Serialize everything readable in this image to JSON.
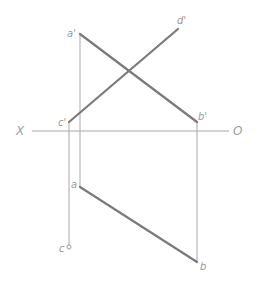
{
  "diagram": {
    "type": "orthographic-projection",
    "axis": {
      "left_label": "X",
      "right_label": "O",
      "y": 131,
      "x1": 32,
      "x2": 229
    },
    "points": {
      "a_prime": {
        "label": "a'",
        "x": 80,
        "y": 34
      },
      "b_prime": {
        "label": "b'",
        "x": 197,
        "y": 122
      },
      "c_prime": {
        "label": "c'",
        "x": 69,
        "y": 122
      },
      "d_prime": {
        "label": "d'",
        "x": 178,
        "y": 29
      },
      "a": {
        "label": "a",
        "x": 80,
        "y": 187
      },
      "b": {
        "label": "b",
        "x": 197,
        "y": 262
      },
      "c": {
        "label": "c",
        "x": 69,
        "y": 247
      }
    },
    "segments": [
      {
        "name": "a'b'",
        "from": "a_prime",
        "to": "b_prime",
        "style": "thick"
      },
      {
        "name": "c'd'",
        "from": "c_prime",
        "to": "d_prime",
        "style": "thick"
      },
      {
        "name": "ab",
        "from": "a",
        "to": "b",
        "style": "thick"
      }
    ],
    "projectors": [
      {
        "name": "a'-a",
        "from": "a_prime",
        "to": "a"
      },
      {
        "name": "b'-b",
        "from": "b_prime",
        "to": "b"
      },
      {
        "name": "c'-c",
        "from": "c_prime",
        "to": "c"
      }
    ],
    "colors": {
      "thick_line": "#7a7a7a",
      "thin_line": "#a8a8a8",
      "label": "#9a9a9a"
    }
  }
}
